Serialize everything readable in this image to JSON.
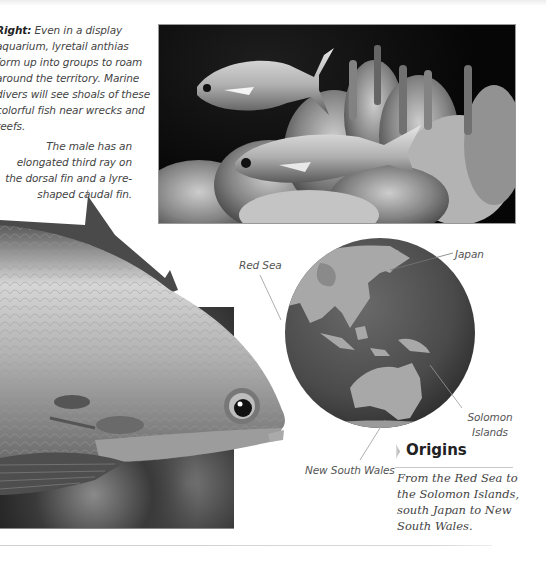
{
  "captions": {
    "right": {
      "lead": "Right:",
      "text": " Even in a display aquarium, lyretail anthias form up into groups to roam around the territory. Marine divers will see shoals of these colorful fish near wrecks and reefs."
    },
    "male": "The male has an elongated third ray on the dorsal fin and a lyre-shaped caudal fin."
  },
  "images": {
    "aquarium": "two lyretail anthias swimming over coral in an aquarium",
    "bigfish": "close-up of a male lyretail anthias head and body",
    "globe": "globe showing Asia, Indonesia and Australia"
  },
  "globe_labels": {
    "red_sea": "Red Sea",
    "japan": "Japan",
    "solomon_line1": "Solomon",
    "solomon_line2": "Islands",
    "nsw": "New South Wales"
  },
  "origins": {
    "heading": "Origins",
    "body": "From the Red Sea to the Solomon Islands, south Japan to New South Wales."
  }
}
